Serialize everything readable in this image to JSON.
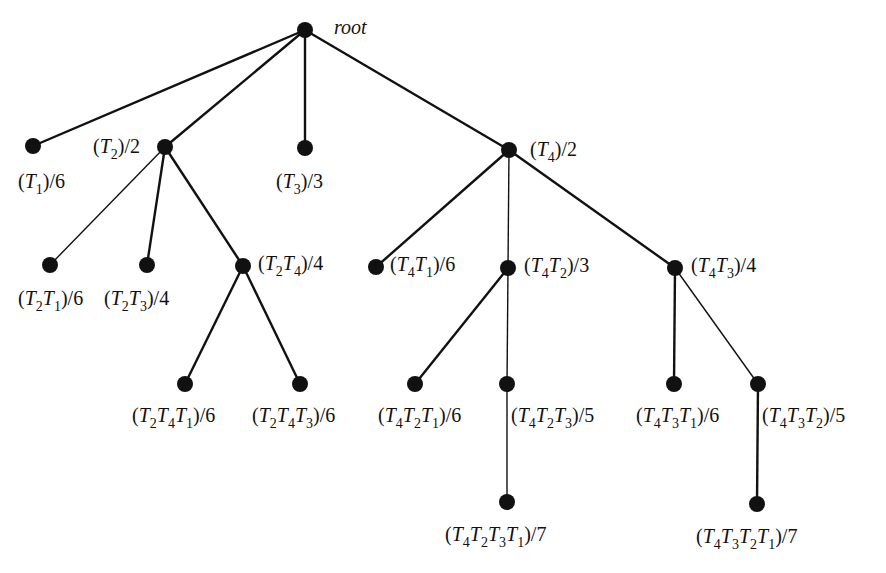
{
  "diagram": {
    "title": "",
    "nodes": [
      {
        "id": "root",
        "x": 305,
        "y": 30,
        "label": "root",
        "lx": 334,
        "ly": 36,
        "italic": true
      },
      {
        "id": "T1",
        "x": 33,
        "y": 146,
        "label": "(T1)/6"
      },
      {
        "id": "T2",
        "x": 165,
        "y": 147,
        "label": "(T2)/2"
      },
      {
        "id": "T3",
        "x": 305,
        "y": 148,
        "label": "(T3)/3"
      },
      {
        "id": "T4",
        "x": 509,
        "y": 150,
        "label": "(T4)/2"
      },
      {
        "id": "T2T1",
        "x": 50,
        "y": 265,
        "label": "(T2T1)/6"
      },
      {
        "id": "T2T3",
        "x": 147,
        "y": 265,
        "label": "(T2T3)/4"
      },
      {
        "id": "T2T4",
        "x": 243,
        "y": 266,
        "label": "(T2T4)/4"
      },
      {
        "id": "T4T1",
        "x": 376,
        "y": 267,
        "label": "(T4T1)/6"
      },
      {
        "id": "T4T2",
        "x": 508,
        "y": 268,
        "label": "(T4T2)/3"
      },
      {
        "id": "T4T3",
        "x": 675,
        "y": 268,
        "label": "(T4T3)/4"
      },
      {
        "id": "T2T4T1",
        "x": 185,
        "y": 384,
        "label": "(T2T4T1)/6"
      },
      {
        "id": "T2T4T3",
        "x": 300,
        "y": 384,
        "label": "(T2T4T3)/6"
      },
      {
        "id": "T4T2T1",
        "x": 415,
        "y": 384,
        "label": "(T4T2T1)/6"
      },
      {
        "id": "T4T2T3",
        "x": 507,
        "y": 384,
        "label": "(T4T2T3)/5"
      },
      {
        "id": "T4T3T1",
        "x": 674,
        "y": 384,
        "label": "(T4T3T1)/6"
      },
      {
        "id": "T4T3T2",
        "x": 758,
        "y": 384,
        "label": "(T4T3T2)/5"
      },
      {
        "id": "T4T2T3T1",
        "x": 507,
        "y": 502,
        "label": "(T4T2T3T1)/7"
      },
      {
        "id": "T4T3T2T1",
        "x": 757,
        "y": 504,
        "label": "(T4T3T2T1)/7"
      }
    ],
    "edges": [
      [
        "root",
        "T1"
      ],
      [
        "root",
        "T2"
      ],
      [
        "root",
        "T3"
      ],
      [
        "root",
        "T4"
      ],
      [
        "T2",
        "T2T1"
      ],
      [
        "T2",
        "T2T3"
      ],
      [
        "T2",
        "T2T4"
      ],
      [
        "T2T4",
        "T2T4T1"
      ],
      [
        "T2T4",
        "T2T4T3"
      ],
      [
        "T4",
        "T4T1"
      ],
      [
        "T4",
        "T4T2"
      ],
      [
        "T4",
        "T4T3"
      ],
      [
        "T4T2",
        "T4T2T1"
      ],
      [
        "T4T2",
        "T4T2T3"
      ],
      [
        "T4T2T3",
        "T4T2T3T1"
      ],
      [
        "T4T3",
        "T4T3T1"
      ],
      [
        "T4T3",
        "T4T3T2"
      ],
      [
        "T4T3T2",
        "T4T3T2T1"
      ]
    ],
    "label_text": {
      "root": "root",
      "T1": "(T1)/6",
      "T2": "(T2)/2",
      "T3": "(T3)/3",
      "T4": "(T4)/2",
      "T2T1": "(T2T1)/6",
      "T2T3": "(T2T3)/4",
      "T2T4": "(T2T4)/4",
      "T4T1": "(T4T1)/6",
      "T4T2": "(T4T2)/3",
      "T4T3": "(T4T3)/4",
      "T2T4T1": "(T2T4T1)/6",
      "T2T4T3": "(T2T4T3)/6",
      "T4T2T1": "(T4T2T1)/6",
      "T4T2T3": "(T4T2T3)/5",
      "T4T3T1": "(T4T3T1)/6",
      "T4T3T2": "(T4T3T2)/5",
      "T4T2T3T1": "(T4T2T3T1)/7",
      "T4T3T2T1": "(T4T3T2T1)/7"
    }
  }
}
